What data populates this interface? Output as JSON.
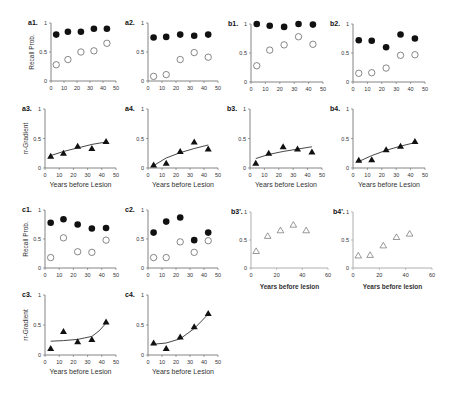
{
  "figure": {
    "ylabel_recall": "Recall Prob.",
    "ylabel_gradient": "rr-Gradient",
    "xlabel": "Years before Lesion",
    "xlabel_lower": "Years before lesion"
  },
  "chart_data": [
    {
      "id": "a1",
      "title": "a1.",
      "type": "scatter",
      "ylabel": "Recall Prob.",
      "xlabel": "",
      "xlim": [
        0,
        50
      ],
      "ylim": [
        0,
        1
      ],
      "xticks": [
        0,
        10,
        20,
        30,
        40,
        50
      ],
      "yticks": [
        0,
        0.5,
        1
      ],
      "x": [
        4,
        13,
        23,
        33,
        43
      ],
      "series": [
        {
          "name": "filled",
          "marker": "filled-circle",
          "values": [
            0.8,
            0.85,
            0.85,
            0.9,
            0.9
          ]
        },
        {
          "name": "open",
          "marker": "open-circle",
          "values": [
            0.28,
            0.37,
            0.5,
            0.52,
            0.65
          ]
        }
      ]
    },
    {
      "id": "a2",
      "title": "a2.",
      "type": "scatter",
      "ylabel": "",
      "xlabel": "",
      "xlim": [
        0,
        50
      ],
      "ylim": [
        0,
        1
      ],
      "xticks": [
        0,
        10,
        20,
        30,
        40,
        50
      ],
      "yticks": [
        0,
        0.5,
        1
      ],
      "x": [
        4,
        13,
        23,
        33,
        43
      ],
      "series": [
        {
          "name": "filled",
          "marker": "filled-circle",
          "values": [
            0.75,
            0.76,
            0.8,
            0.78,
            0.8
          ]
        },
        {
          "name": "open",
          "marker": "open-circle",
          "values": [
            0.08,
            0.11,
            0.37,
            0.49,
            0.41
          ]
        }
      ]
    },
    {
      "id": "b1",
      "title": "b1.",
      "type": "scatter",
      "ylabel": "",
      "xlabel": "",
      "xlim": [
        0,
        50
      ],
      "ylim": [
        0,
        1
      ],
      "xticks": [
        0,
        10,
        20,
        30,
        40,
        50
      ],
      "yticks": [
        0,
        0.5,
        1
      ],
      "x": [
        4,
        13,
        23,
        33,
        43
      ],
      "series": [
        {
          "name": "filled",
          "marker": "filled-circle",
          "values": [
            1.0,
            0.97,
            0.95,
            1.0,
            0.99
          ]
        },
        {
          "name": "open",
          "marker": "open-circle",
          "values": [
            0.28,
            0.55,
            0.64,
            0.78,
            0.65
          ]
        }
      ]
    },
    {
      "id": "b2",
      "title": "b2.",
      "type": "scatter",
      "ylabel": "",
      "xlabel": "",
      "xlim": [
        0,
        50
      ],
      "ylim": [
        0,
        1
      ],
      "xticks": [
        0,
        10,
        20,
        30,
        40,
        50
      ],
      "yticks": [
        0,
        0.5,
        1
      ],
      "x": [
        4,
        13,
        23,
        33,
        43
      ],
      "series": [
        {
          "name": "filled",
          "marker": "filled-circle",
          "values": [
            0.72,
            0.71,
            0.6,
            0.82,
            0.75
          ]
        },
        {
          "name": "open",
          "marker": "open-circle",
          "values": [
            0.15,
            0.16,
            0.24,
            0.46,
            0.47
          ]
        }
      ]
    },
    {
      "id": "a3",
      "title": "a3.",
      "type": "scatter",
      "ylabel": "rr-Gradient",
      "xlabel": "Years before Lesion",
      "xlim": [
        0,
        50
      ],
      "ylim": [
        0,
        1
      ],
      "xticks": [
        0,
        10,
        20,
        30,
        40,
        50
      ],
      "yticks": [
        0,
        0.5,
        1
      ],
      "x": [
        4,
        13,
        23,
        33,
        43
      ],
      "series": [
        {
          "name": "gradient",
          "marker": "filled-triangle",
          "values": [
            0.2,
            0.25,
            0.37,
            0.33,
            0.45
          ]
        }
      ],
      "fit": {
        "x": [
          4,
          13,
          23,
          33,
          43
        ],
        "y": [
          0.21,
          0.28,
          0.34,
          0.4,
          0.44
        ]
      }
    },
    {
      "id": "a4",
      "title": "a4.",
      "type": "scatter",
      "ylabel": "",
      "xlabel": "Years before Lesion",
      "xlim": [
        0,
        50
      ],
      "ylim": [
        0,
        1
      ],
      "xticks": [
        0,
        10,
        20,
        30,
        40,
        50
      ],
      "yticks": [
        0,
        0.5,
        1
      ],
      "x": [
        4,
        13,
        23,
        33,
        43
      ],
      "series": [
        {
          "name": "gradient",
          "marker": "filled-triangle",
          "values": [
            0.05,
            0.08,
            0.28,
            0.44,
            0.32
          ]
        }
      ],
      "fit": {
        "x": [
          4,
          13,
          23,
          33,
          43
        ],
        "y": [
          0.04,
          0.17,
          0.26,
          0.33,
          0.39
        ]
      }
    },
    {
      "id": "b3",
      "title": "b3.",
      "type": "scatter",
      "ylabel": "",
      "xlabel": "Years before Lesion",
      "xlim": [
        0,
        50
      ],
      "ylim": [
        0,
        1
      ],
      "xticks": [
        0,
        10,
        20,
        30,
        40,
        50
      ],
      "yticks": [
        0,
        0.5,
        1
      ],
      "x": [
        4,
        13,
        23,
        33,
        43
      ],
      "series": [
        {
          "name": "gradient",
          "marker": "filled-triangle",
          "values": [
            0.08,
            0.25,
            0.36,
            0.32,
            0.27
          ]
        }
      ],
      "fit": {
        "x": [
          4,
          13,
          23,
          33,
          43
        ],
        "y": [
          0.16,
          0.23,
          0.28,
          0.32,
          0.36
        ]
      }
    },
    {
      "id": "b4",
      "title": "b4.",
      "type": "scatter",
      "ylabel": "",
      "xlabel": "Years before Lesion",
      "xlim": [
        0,
        50
      ],
      "ylim": [
        0,
        1
      ],
      "xticks": [
        0,
        10,
        20,
        30,
        40,
        50
      ],
      "yticks": [
        0,
        0.5,
        1
      ],
      "x": [
        4,
        13,
        23,
        33,
        43
      ],
      "series": [
        {
          "name": "gradient",
          "marker": "filled-triangle",
          "values": [
            0.13,
            0.14,
            0.31,
            0.37,
            0.45
          ]
        }
      ],
      "fit": {
        "x": [
          4,
          13,
          23,
          33,
          43
        ],
        "y": [
          0.11,
          0.21,
          0.3,
          0.37,
          0.43
        ]
      }
    },
    {
      "id": "c1",
      "title": "c1.",
      "type": "scatter",
      "ylabel": "Recall Prob.",
      "xlabel": "",
      "xlim": [
        0,
        50
      ],
      "ylim": [
        0,
        1
      ],
      "xticks": [
        0,
        10,
        20,
        30,
        40,
        50
      ],
      "yticks": [
        0,
        0.5,
        1
      ],
      "x": [
        4,
        13,
        23,
        33,
        43
      ],
      "series": [
        {
          "name": "filled",
          "marker": "filled-circle",
          "values": [
            0.78,
            0.84,
            0.75,
            0.68,
            0.69
          ]
        },
        {
          "name": "open",
          "marker": "open-circle",
          "values": [
            0.18,
            0.52,
            0.28,
            0.27,
            0.48
          ]
        }
      ]
    },
    {
      "id": "c2",
      "title": "c2.",
      "type": "scatter",
      "ylabel": "",
      "xlabel": "",
      "xlim": [
        0,
        50
      ],
      "ylim": [
        0,
        1
      ],
      "xticks": [
        0,
        10,
        20,
        30,
        40,
        50
      ],
      "yticks": [
        0,
        0.5,
        1
      ],
      "x": [
        4,
        13,
        23,
        33,
        43
      ],
      "series": [
        {
          "name": "filled",
          "marker": "filled-circle",
          "values": [
            0.61,
            0.8,
            0.87,
            0.48,
            0.61
          ]
        },
        {
          "name": "open",
          "marker": "open-circle",
          "values": [
            0.18,
            0.18,
            0.45,
            0.27,
            0.47
          ]
        }
      ]
    },
    {
      "id": "b3p",
      "title": "b3'.",
      "type": "scatter",
      "ylabel": "",
      "xlabel": "Years before lesion",
      "xlim": [
        0,
        60
      ],
      "ylim": [
        0,
        1
      ],
      "xticks": [
        0,
        20,
        40,
        60
      ],
      "yticks": [
        0,
        0.5,
        1
      ],
      "x": [
        4,
        13,
        23,
        33,
        43
      ],
      "series": [
        {
          "name": "open-triangle",
          "marker": "open-triangle",
          "values": [
            0.3,
            0.57,
            0.67,
            0.77,
            0.67
          ]
        }
      ]
    },
    {
      "id": "b4p",
      "title": "b4'.",
      "type": "scatter",
      "ylabel": "",
      "xlabel": "Years before lesion",
      "xlim": [
        0,
        60
      ],
      "ylim": [
        0,
        1
      ],
      "xticks": [
        0,
        20,
        40,
        60
      ],
      "yticks": [
        0,
        0.5,
        1
      ],
      "x": [
        4,
        13,
        23,
        33,
        43
      ],
      "series": [
        {
          "name": "open-triangle",
          "marker": "open-triangle",
          "values": [
            0.22,
            0.23,
            0.4,
            0.55,
            0.61
          ]
        }
      ]
    },
    {
      "id": "c3",
      "title": "c3.",
      "type": "scatter",
      "ylabel": "rr-Gradient",
      "xlabel": "Years before Lesion",
      "xlim": [
        0,
        50
      ],
      "ylim": [
        0,
        1
      ],
      "xticks": [
        0,
        10,
        20,
        30,
        40,
        50
      ],
      "yticks": [
        0,
        0.5,
        1
      ],
      "x": [
        4,
        13,
        23,
        33,
        43
      ],
      "series": [
        {
          "name": "gradient",
          "marker": "filled-triangle",
          "values": [
            0.11,
            0.39,
            0.22,
            0.26,
            0.55
          ]
        }
      ],
      "fit": {
        "x": [
          4,
          13,
          23,
          33,
          38,
          43
        ],
        "y": [
          0.23,
          0.24,
          0.26,
          0.31,
          0.4,
          0.53
        ]
      }
    },
    {
      "id": "c4",
      "title": "c4.",
      "type": "scatter",
      "ylabel": "",
      "xlabel": "Years before Lesion",
      "xlim": [
        0,
        50
      ],
      "ylim": [
        0,
        1
      ],
      "xticks": [
        0,
        10,
        20,
        30,
        40,
        50
      ],
      "yticks": [
        0,
        0.5,
        1
      ],
      "x": [
        4,
        13,
        23,
        33,
        43
      ],
      "series": [
        {
          "name": "gradient",
          "marker": "filled-triangle",
          "values": [
            0.2,
            0.11,
            0.3,
            0.47,
            0.69
          ]
        }
      ],
      "fit": {
        "x": [
          4,
          13,
          23,
          33,
          43
        ],
        "y": [
          0.18,
          0.2,
          0.27,
          0.44,
          0.68
        ]
      }
    }
  ],
  "layout": [
    {
      "id": "a1",
      "x0": 51,
      "y0": 23,
      "w": 65,
      "h": 58
    },
    {
      "id": "a2",
      "x0": 148,
      "y0": 23,
      "w": 70,
      "h": 58
    },
    {
      "id": "b1",
      "x0": 251,
      "y0": 24,
      "w": 72,
      "h": 58
    },
    {
      "id": "b2",
      "x0": 353,
      "y0": 24,
      "w": 72,
      "h": 58
    },
    {
      "id": "a3",
      "x0": 45,
      "y0": 109,
      "w": 71,
      "h": 59
    },
    {
      "id": "a4",
      "x0": 148,
      "y0": 109,
      "w": 70,
      "h": 59
    },
    {
      "id": "b3",
      "x0": 250,
      "y0": 109,
      "w": 72,
      "h": 59
    },
    {
      "id": "b4",
      "x0": 353,
      "y0": 109,
      "w": 72,
      "h": 59
    },
    {
      "id": "c1",
      "x0": 45,
      "y0": 210,
      "w": 71,
      "h": 58
    },
    {
      "id": "c2",
      "x0": 148,
      "y0": 210,
      "w": 70,
      "h": 58
    },
    {
      "id": "b3p",
      "x0": 251,
      "y0": 212,
      "w": 77,
      "h": 56
    },
    {
      "id": "b4p",
      "x0": 353,
      "y0": 212,
      "w": 79,
      "h": 56
    },
    {
      "id": "c3",
      "x0": 45,
      "y0": 295,
      "w": 71,
      "h": 60
    },
    {
      "id": "c4",
      "x0": 148,
      "y0": 295,
      "w": 70,
      "h": 60
    }
  ]
}
